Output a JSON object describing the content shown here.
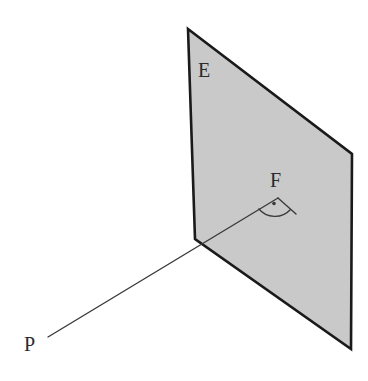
{
  "figure": {
    "background_color": "#ffffff",
    "labels": {
      "plane": "E",
      "foot_of_perpendicular": "F",
      "point": "P"
    },
    "colors": {
      "plane_fill": "#c9c9c9",
      "plane_stroke": "#1a1a1a",
      "ray_stroke": "#3a3a3a",
      "angle_marker_stroke": "#3a3a3a",
      "label_color": "#2b2b2b"
    },
    "geometry": {
      "plane_polygon": "188,29 352,154 351,349 195,239",
      "plane_vertices": [
        {
          "name": "top-left",
          "x": 188,
          "y": 29
        },
        {
          "name": "top-right",
          "x": 352,
          "y": 154
        },
        {
          "name": "bottom-right",
          "x": 351,
          "y": 349
        },
        {
          "name": "bottom-left",
          "x": 195,
          "y": 239
        }
      ],
      "segment_PF": {
        "x1": 48,
        "y1": 337,
        "x2": 278,
        "y2": 198
      },
      "segment_in_plane": {
        "x1": 278,
        "y1": 198,
        "x2": 296,
        "y2": 214
      },
      "angle_marker": {
        "arc_path": "M 258.5 208.5 A 21 21 0 0 0 290.5 209.5",
        "dot_x": 274,
        "dot_y": 203.5,
        "dot_r": 1.8
      }
    },
    "stroke_widths": {
      "plane_outline": 2.6,
      "ray": 1.4,
      "angle_marker": 1.3
    }
  }
}
